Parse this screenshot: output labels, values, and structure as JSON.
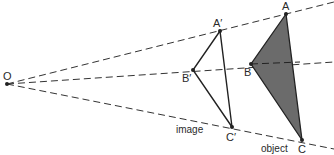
{
  "diagram": {
    "type": "enlargement-with-negative-scale-projection",
    "centre": {
      "label": "O",
      "x": 7,
      "y": 84
    },
    "object": {
      "label": "object",
      "fill": "#6b6b6b",
      "vertices": [
        {
          "label": "A",
          "x": 286,
          "y": 14
        },
        {
          "label": "B",
          "x": 251,
          "y": 64
        },
        {
          "label": "C",
          "x": 302,
          "y": 140
        }
      ]
    },
    "image": {
      "label": "image",
      "vertices": [
        {
          "label": "A′",
          "x": 220,
          "y": 31
        },
        {
          "label": "B′",
          "x": 193,
          "y": 70
        },
        {
          "label": "C′",
          "x": 232,
          "y": 127
        }
      ]
    },
    "rays": [
      {
        "from": "O",
        "through": "A",
        "x2": 334,
        "y2": 2
      },
      {
        "from": "O",
        "through": "B",
        "x2": 334,
        "y2": 62
      },
      {
        "from": "O",
        "through": "C",
        "x2": 334,
        "y2": 149
      }
    ],
    "line_color": "#333333"
  }
}
